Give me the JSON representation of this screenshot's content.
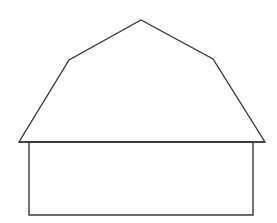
{
  "canvas": {
    "width": 277,
    "height": 223,
    "background_color": "#ffffff",
    "title": "Barn outline line drawing"
  },
  "style": {
    "stroke_color": "#3a3a3c",
    "stroke_width": 1.4,
    "fill_color": "#ffffff"
  },
  "drawing": {
    "name": "barn-house-outline",
    "description": "Simple black-and-white line drawing of a barn: a gambrel roof with a peaked apex and two shoulder bends sitting on a plain rectangular wall.",
    "parts": [
      {
        "name": "roof",
        "label": "Gambrel roof",
        "points": [
          {
            "label": "left-eave-tip",
            "x": 19,
            "y": 142
          },
          {
            "label": "left-shoulder",
            "x": 69,
            "y": 60
          },
          {
            "label": "apex",
            "x": 141,
            "y": 20
          },
          {
            "label": "right-shoulder",
            "x": 213,
            "y": 59
          },
          {
            "label": "right-eave-tip",
            "x": 265,
            "y": 142
          }
        ],
        "path": "M 19 142 L 69 60 L 141 20 L 213 59 L 265 142 Z"
      },
      {
        "name": "wall",
        "label": "Rectangular wall body",
        "points": [
          {
            "label": "top-left",
            "x": 29,
            "y": 142
          },
          {
            "label": "top-right",
            "x": 253,
            "y": 142
          },
          {
            "label": "bottom-right",
            "x": 253,
            "y": 215
          },
          {
            "label": "bottom-left",
            "x": 29,
            "y": 215
          }
        ],
        "path": "M 29 142 L 253 142 L 253 215 L 29 215 Z"
      },
      {
        "name": "eave-line",
        "label": "Horizontal eave line under the roof",
        "path": "M 19 142 L 265 142"
      }
    ]
  }
}
